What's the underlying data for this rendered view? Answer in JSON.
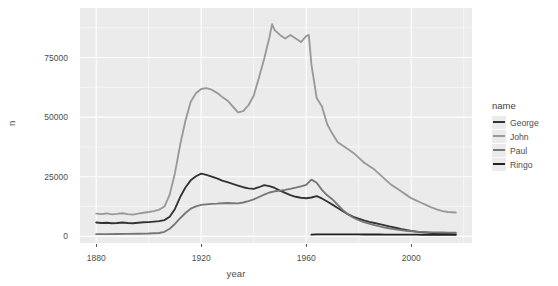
{
  "chart_data": {
    "type": "line",
    "title": "",
    "xlabel": "year",
    "ylabel": "n",
    "xlim": [
      1880,
      2017
    ],
    "ylim": [
      0,
      93000
    ],
    "grid": true,
    "panel_background": "#ebebeb",
    "gridline_color": "#ffffff",
    "legend_position": "right",
    "legend_title": "name",
    "xticks": [
      1880,
      1920,
      1960,
      2000
    ],
    "xtick_labels": [
      "1880",
      "1920",
      "1960",
      "2000"
    ],
    "yticks": [
      0,
      25000,
      50000,
      75000
    ],
    "ytick_labels": [
      "0",
      "25000",
      "50000",
      "75000"
    ],
    "series": [
      {
        "name": "George",
        "color": "#333333",
        "x": [
          1880,
          1882,
          1884,
          1886,
          1888,
          1890,
          1892,
          1894,
          1896,
          1898,
          1900,
          1902,
          1904,
          1906,
          1908,
          1910,
          1912,
          1914,
          1916,
          1918,
          1920,
          1922,
          1924,
          1926,
          1928,
          1930,
          1932,
          1934,
          1936,
          1938,
          1940,
          1942,
          1944,
          1946,
          1948,
          1950,
          1952,
          1954,
          1956,
          1958,
          1960,
          1962,
          1964,
          1966,
          1968,
          1970,
          1972,
          1974,
          1976,
          1978,
          1980,
          1982,
          1984,
          1986,
          1988,
          1990,
          1992,
          1994,
          1996,
          1998,
          2000,
          2002,
          2004,
          2006,
          2008,
          2010,
          2012,
          2014,
          2017
        ],
        "values": [
          5800,
          5600,
          5700,
          5500,
          5600,
          5800,
          5600,
          5500,
          5700,
          5900,
          6000,
          6200,
          6400,
          6800,
          8200,
          11500,
          16500,
          20500,
          23500,
          25200,
          26300,
          25800,
          25100,
          24300,
          23400,
          22700,
          22000,
          21300,
          20600,
          20100,
          19900,
          20600,
          21500,
          21100,
          20300,
          19200,
          18200,
          17300,
          16600,
          16200,
          16000,
          16300,
          16900,
          15900,
          14600,
          13300,
          11900,
          10500,
          9200,
          8200,
          7400,
          6700,
          6100,
          5600,
          5100,
          4600,
          4100,
          3600,
          3100,
          2700,
          2300,
          2000,
          1750,
          1550,
          1400,
          1250,
          1150,
          1050,
          950
        ]
      },
      {
        "name": "John",
        "color": "#999999",
        "x": [
          1880,
          1882,
          1884,
          1886,
          1888,
          1890,
          1892,
          1894,
          1896,
          1898,
          1900,
          1902,
          1904,
          1906,
          1908,
          1910,
          1912,
          1914,
          1916,
          1918,
          1920,
          1922,
          1924,
          1926,
          1928,
          1930,
          1932,
          1934,
          1936,
          1938,
          1940,
          1942,
          1944,
          1946,
          1947,
          1948,
          1950,
          1952,
          1954,
          1956,
          1958,
          1960,
          1961,
          1962,
          1964,
          1966,
          1968,
          1970,
          1972,
          1974,
          1976,
          1978,
          1980,
          1982,
          1984,
          1986,
          1988,
          1990,
          1992,
          1994,
          1996,
          1998,
          2000,
          2002,
          2004,
          2006,
          2008,
          2010,
          2012,
          2014,
          2017
        ],
        "values": [
          9500,
          9300,
          9600,
          9200,
          9400,
          9700,
          9300,
          9100,
          9500,
          9900,
          10200,
          10600,
          11200,
          12500,
          17500,
          26500,
          38500,
          48500,
          56500,
          60000,
          61800,
          62200,
          61500,
          60200,
          58500,
          57000,
          54500,
          52000,
          52500,
          55000,
          59000,
          66500,
          74500,
          83500,
          89000,
          86500,
          84500,
          83000,
          84500,
          83000,
          81500,
          84000,
          84500,
          72000,
          58000,
          54500,
          47000,
          43000,
          39500,
          38000,
          36500,
          35000,
          33000,
          31000,
          29500,
          28000,
          26000,
          24000,
          22000,
          20500,
          19000,
          17500,
          16000,
          15000,
          14000,
          13000,
          12000,
          11200,
          10600,
          10200,
          10000
        ]
      },
      {
        "name": "Paul",
        "color": "#777777",
        "x": [
          1880,
          1884,
          1888,
          1892,
          1896,
          1900,
          1904,
          1906,
          1908,
          1910,
          1912,
          1914,
          1916,
          1918,
          1920,
          1922,
          1924,
          1926,
          1928,
          1930,
          1932,
          1934,
          1936,
          1938,
          1940,
          1942,
          1944,
          1946,
          1948,
          1950,
          1952,
          1954,
          1956,
          1958,
          1960,
          1962,
          1964,
          1966,
          1968,
          1970,
          1972,
          1974,
          1976,
          1978,
          1980,
          1982,
          1984,
          1986,
          1988,
          1990,
          1992,
          1994,
          1996,
          1998,
          2000,
          2002,
          2004,
          2006,
          2008,
          2010,
          2012,
          2014,
          2017
        ],
        "values": [
          900,
          950,
          1000,
          1050,
          1100,
          1200,
          1400,
          1900,
          3200,
          5200,
          7600,
          9800,
          11600,
          12600,
          13200,
          13400,
          13600,
          13700,
          13900,
          14000,
          13900,
          13800,
          14200,
          14800,
          15500,
          16500,
          17500,
          18400,
          18900,
          19200,
          19500,
          19900,
          20400,
          21000,
          21600,
          23800,
          22500,
          19500,
          17200,
          15500,
          13200,
          11000,
          9200,
          7800,
          6800,
          6000,
          5300,
          4700,
          4200,
          3700,
          3300,
          2900,
          2600,
          2350,
          2150,
          2000,
          1900,
          1800,
          1700,
          1650,
          1600,
          1550,
          1500
        ]
      },
      {
        "name": "Ringo",
        "color": "#222222",
        "x": [
          1962,
          1964,
          1966,
          1968,
          1970,
          1972,
          1974,
          1976,
          1978,
          1980,
          1982,
          1984,
          1986,
          1988,
          1990,
          1992,
          1994,
          1996,
          1998,
          2000,
          2002,
          2004,
          2006,
          2008,
          2010,
          2012,
          2014,
          2017
        ],
        "values": [
          700,
          800,
          850,
          860,
          850,
          840,
          830,
          820,
          810,
          800,
          790,
          780,
          770,
          760,
          750,
          740,
          730,
          720,
          710,
          700,
          690,
          680,
          670,
          660,
          650,
          640,
          630,
          620
        ]
      }
    ]
  },
  "legend": {
    "title": "name",
    "entries": [
      {
        "label": "George",
        "color": "#333333"
      },
      {
        "label": "John",
        "color": "#999999"
      },
      {
        "label": "Paul",
        "color": "#777777"
      },
      {
        "label": "Ringo",
        "color": "#222222"
      }
    ]
  },
  "axes": {
    "x": {
      "title": "year",
      "ticks": [
        {
          "value": 1880,
          "label": "1880"
        },
        {
          "value": 1920,
          "label": "1920"
        },
        {
          "value": 1960,
          "label": "1960"
        },
        {
          "value": 2000,
          "label": "2000"
        }
      ]
    },
    "y": {
      "title": "n",
      "ticks": [
        {
          "value": 0,
          "label": "0"
        },
        {
          "value": 25000,
          "label": "25000"
        },
        {
          "value": 50000,
          "label": "50000"
        },
        {
          "value": 75000,
          "label": "75000"
        }
      ]
    }
  }
}
